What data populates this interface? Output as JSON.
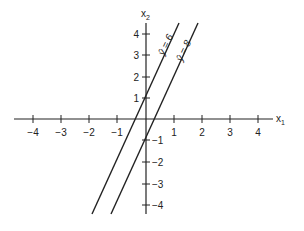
{
  "figure": {
    "type": "coordinate-plane-diagram",
    "x_axis": {
      "label": "x",
      "label_sub": "1",
      "ticks": [
        "−4",
        "−3",
        "−2",
        "−1",
        "1",
        "2",
        "3",
        "4"
      ],
      "range": [
        -4.7,
        4.5
      ]
    },
    "y_axis": {
      "label": "x",
      "label_sub": "2",
      "ticks_pos": [
        "1",
        "2",
        "3",
        "4"
      ],
      "ticks_neg": [
        "−1",
        "−2",
        "−3",
        "−4"
      ],
      "range": [
        -4.5,
        4.5
      ]
    },
    "lines": [
      {
        "label": "ŷ = 6",
        "description": "steep line through (0, 1)"
      },
      {
        "label": "ŷ = 8",
        "description": "parallel steep line through (0, −1)"
      }
    ],
    "colors": {
      "ink": "#222222",
      "background": "#ffffff"
    }
  }
}
